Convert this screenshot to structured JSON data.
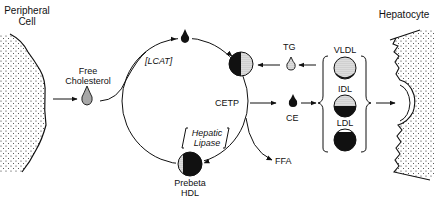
{
  "diagram": {
    "type": "reverse cholesterol transport pathway",
    "labels": {
      "peripheral_cell_line1": "Peripheral",
      "peripheral_cell_line2": "Cell",
      "free_cholesterol_line1": "Free",
      "free_cholesterol_line2": "Cholesterol",
      "lcat": "[LCAT]",
      "tg": "TG",
      "cetp": "CETP",
      "ce": "CE",
      "hepatic_lipase_line1": "Hepatic",
      "hepatic_lipase_line2": "Lipase",
      "ffa": "FFA",
      "prebeta_hdl_line1": "Prebeta",
      "prebeta_hdl_line2": "HDL",
      "vldl": "VLDL",
      "idl": "IDL",
      "ldl": "LDL",
      "hepatocyte": "Hepatocyte"
    },
    "nodes": [
      {
        "id": "peripheral-cell",
        "label": "Peripheral Cell"
      },
      {
        "id": "free-cholesterol",
        "label": "Free Cholesterol",
        "icon": "striped-droplet"
      },
      {
        "id": "cholesterol-ester-droplet",
        "icon": "black-droplet"
      },
      {
        "id": "mature-hdl",
        "icon": "half-filled-circle"
      },
      {
        "id": "tg",
        "label": "TG",
        "icon": "hollow-droplet"
      },
      {
        "id": "ce",
        "label": "CE",
        "icon": "black-droplet"
      },
      {
        "id": "ffa",
        "label": "FFA"
      },
      {
        "id": "prebeta-hdl",
        "label": "Prebeta HDL",
        "icon": "mostly-filled-circle"
      },
      {
        "id": "vldl",
        "label": "VLDL",
        "icon": "dotted-circle"
      },
      {
        "id": "idl",
        "label": "IDL",
        "icon": "half-dotted-circle"
      },
      {
        "id": "ldl",
        "label": "LDL",
        "icon": "filled-circle"
      },
      {
        "id": "hepatocyte",
        "label": "Hepatocyte"
      }
    ],
    "edges": [
      {
        "from": "peripheral-cell",
        "to": "free-cholesterol"
      },
      {
        "from": "free-cholesterol",
        "to": "cholesterol-ester-droplet",
        "via": "LCAT"
      },
      {
        "from": "cholesterol-ester-droplet",
        "to": "mature-hdl"
      },
      {
        "from": "tg",
        "to": "mature-hdl"
      },
      {
        "from": "vldl-group",
        "to": "tg"
      },
      {
        "from": "mature-hdl",
        "to": "ce",
        "via": "CETP"
      },
      {
        "from": "ce",
        "to": "vldl-group"
      },
      {
        "from": "mature-hdl",
        "to": "prebeta-hdl",
        "via": "Hepatic Lipase"
      },
      {
        "from": "mature-hdl",
        "to": "ffa"
      },
      {
        "from": "vldl-group",
        "to": "hepatocyte"
      }
    ]
  }
}
